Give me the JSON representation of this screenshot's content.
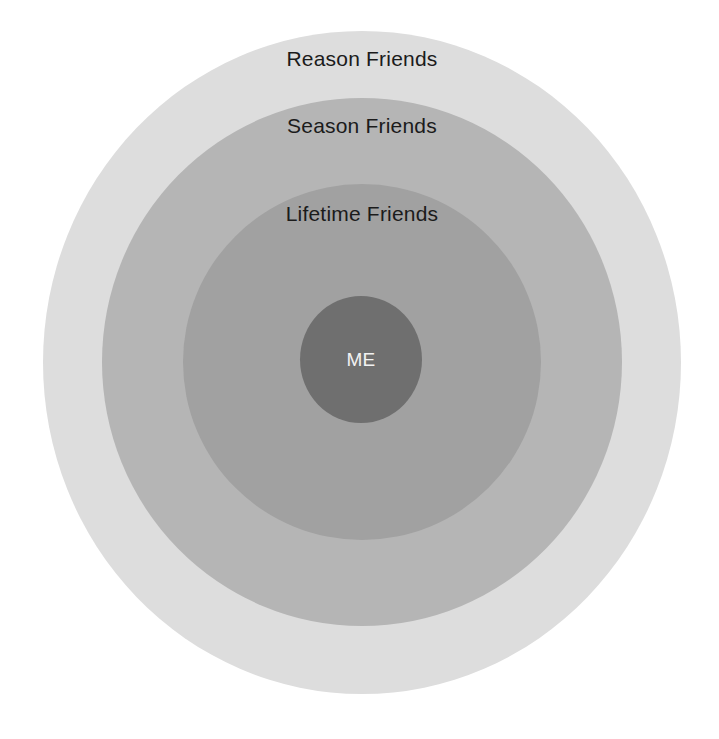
{
  "diagram": {
    "type": "concentric-circles",
    "background_color": "#ffffff",
    "rings": [
      {
        "id": "reason-friends",
        "label": "Reason Friends",
        "level": 1,
        "color": "#dddddd",
        "text_color": "#1b1b1b"
      },
      {
        "id": "season-friends",
        "label": "Season Friends",
        "level": 2,
        "color": "#b5b5b5",
        "text_color": "#1b1b1b"
      },
      {
        "id": "lifetime-friends",
        "label": "Lifetime Friends",
        "level": 3,
        "color": "#a1a1a1",
        "text_color": "#1b1b1b"
      },
      {
        "id": "me",
        "label": "ME",
        "level": 4,
        "color": "#6f6f6f",
        "text_color": "#f2f2f2"
      }
    ]
  }
}
